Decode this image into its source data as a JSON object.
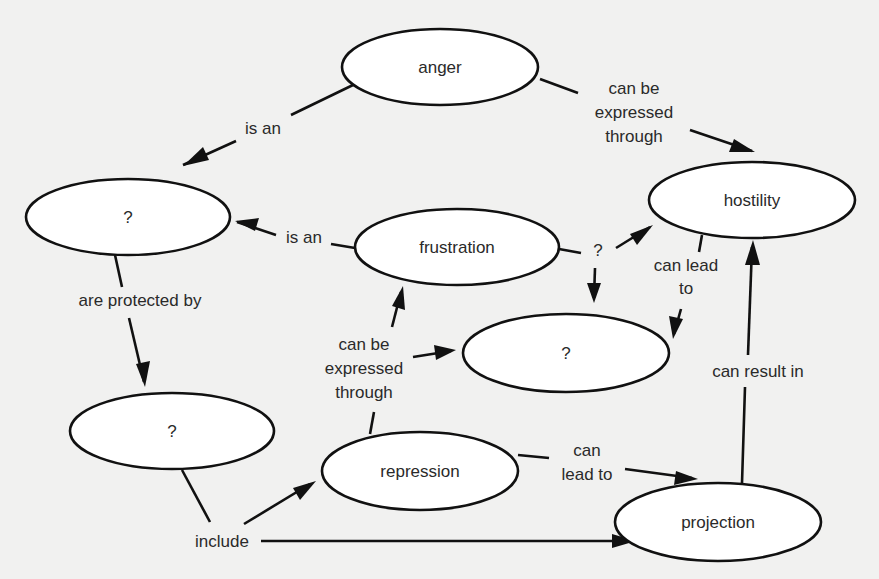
{
  "diagram": {
    "type": "concept-map",
    "colors": {
      "background": "#f1f1f0",
      "node_fill": "#ffffff",
      "stroke": "#111111",
      "text": "#2a2a2a"
    },
    "nodes": [
      {
        "id": "anger",
        "label": "anger",
        "cx": 440,
        "cy": 67,
        "rx": 98,
        "ry": 38
      },
      {
        "id": "unknown_top_left",
        "label": "?",
        "cx": 128,
        "cy": 217,
        "rx": 102,
        "ry": 38
      },
      {
        "id": "frustration",
        "label": "frustration",
        "cx": 457,
        "cy": 247,
        "rx": 102,
        "ry": 38
      },
      {
        "id": "hostility",
        "label": "hostility",
        "cx": 752,
        "cy": 200,
        "rx": 103,
        "ry": 38
      },
      {
        "id": "unknown_middle",
        "label": "?",
        "cx": 566,
        "cy": 353,
        "rx": 103,
        "ry": 39
      },
      {
        "id": "unknown_bottom_left",
        "label": "?",
        "cx": 172,
        "cy": 431,
        "rx": 102,
        "ry": 38
      },
      {
        "id": "repression",
        "label": "repression",
        "cx": 420,
        "cy": 471,
        "rx": 98,
        "ry": 39
      },
      {
        "id": "projection",
        "label": "projection",
        "cx": 718,
        "cy": 522,
        "rx": 103,
        "ry": 39
      }
    ],
    "edges": [
      {
        "from": "anger",
        "to": "unknown_top_left",
        "label": [
          "is an"
        ]
      },
      {
        "from": "anger",
        "to": "hostility",
        "label": [
          "can be",
          "expressed",
          "through"
        ]
      },
      {
        "from": "frustration",
        "to": "unknown_top_left",
        "label": [
          "is an"
        ]
      },
      {
        "from": "frustration",
        "to": "hostility",
        "label": [
          "?"
        ]
      },
      {
        "from": "frustration",
        "to": "unknown_middle",
        "label": [
          "?"
        ]
      },
      {
        "from": "unknown_top_left",
        "to": "unknown_bottom_left",
        "label": [
          "are protected by"
        ]
      },
      {
        "from": "hostility",
        "to": "unknown_middle",
        "label": [
          "can lead",
          "to"
        ]
      },
      {
        "from": "repression",
        "to": "frustration",
        "label": [
          "can be",
          "expressed",
          "through"
        ]
      },
      {
        "from": "repression",
        "to": "unknown_middle",
        "label": [
          "can be",
          "expressed",
          "through"
        ]
      },
      {
        "from": "unknown_bottom_left",
        "to": "repression",
        "label": [
          "include"
        ]
      },
      {
        "from": "unknown_bottom_left",
        "to": "projection",
        "label": [
          "include"
        ]
      },
      {
        "from": "repression",
        "to": "projection",
        "label": [
          "can",
          "lead to"
        ]
      },
      {
        "from": "projection",
        "to": "hostility",
        "label": [
          "can result in"
        ]
      }
    ]
  },
  "labels": {
    "anger": "anger",
    "unknown_top_left": "?",
    "frustration": "frustration",
    "hostility": "hostility",
    "unknown_middle": "?",
    "unknown_bottom_left": "?",
    "repression": "repression",
    "projection": "projection",
    "is_an_1": "is an",
    "is_an_2": "is an",
    "anger_hostility_1": "can be",
    "anger_hostility_2": "expressed",
    "anger_hostility_3": "through",
    "frustration_q": "?",
    "are_protected_by": "are protected by",
    "hostility_lead_1": "can lead",
    "hostility_lead_2": "to",
    "repression_expr_1": "can be",
    "repression_expr_2": "expressed",
    "repression_expr_3": "through",
    "include": "include",
    "repression_lead_1": "can",
    "repression_lead_2": "lead to",
    "can_result_in": "can result in"
  }
}
